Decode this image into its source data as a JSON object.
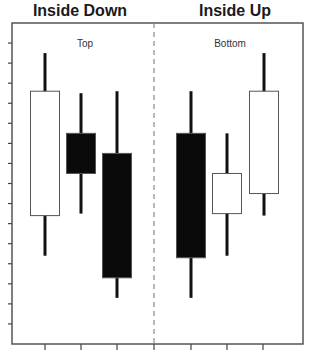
{
  "chart_data": {
    "type": "candlestick",
    "title_left": "Inside Down",
    "title_right": "Inside Up",
    "panel_labels": [
      "Top",
      "Bottom"
    ],
    "xlabel": "",
    "ylabel": "",
    "y_ticks_shown": true,
    "y_tick_labels": [],
    "x_tick_labels": [],
    "grid": false,
    "divider": "dashed vertical line between panels",
    "ylim": [
      0,
      16
    ],
    "panels": [
      {
        "name": "Inside Down",
        "label": "Top",
        "candles": [
          {
            "index": 1,
            "color": "white",
            "open": 6.4,
            "close": 12.6,
            "high": 14.5,
            "low": 4.4
          },
          {
            "index": 2,
            "color": "black",
            "open": 10.5,
            "close": 8.5,
            "high": 12.5,
            "low": 6.5
          },
          {
            "index": 3,
            "color": "black",
            "open": 9.5,
            "close": 3.3,
            "high": 12.6,
            "low": 2.3
          }
        ]
      },
      {
        "name": "Inside Up",
        "label": "Bottom",
        "candles": [
          {
            "index": 4,
            "color": "black",
            "open": 10.5,
            "close": 4.3,
            "high": 12.6,
            "low": 2.3
          },
          {
            "index": 5,
            "color": "white",
            "open": 6.5,
            "close": 8.5,
            "high": 10.5,
            "low": 4.4
          },
          {
            "index": 6,
            "color": "white",
            "open": 7.5,
            "close": 12.6,
            "high": 14.5,
            "low": 6.4
          }
        ]
      }
    ]
  },
  "titles": {
    "left": "Inside Down",
    "right": "Inside Up"
  },
  "labels": {
    "left": "Top",
    "right": "Bottom"
  },
  "colors": {
    "frame": "#555555",
    "candle_black": "#0a0a0a",
    "candle_white": "#ffffff",
    "wick": "#111111",
    "divider": "#888888"
  }
}
